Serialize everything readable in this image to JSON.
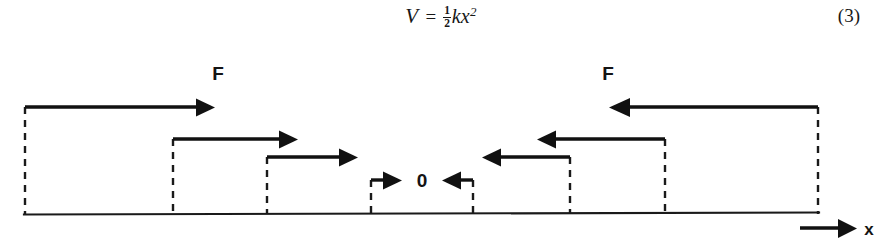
{
  "equation": {
    "variable": "V",
    "equals": "=",
    "fraction_numerator": "1",
    "fraction_denominator": "2",
    "body": "kx",
    "exponent": "2",
    "full_text": "V = 1/2 k x^2",
    "number": "(3)"
  },
  "diagram": {
    "axis_label_x": "x",
    "origin_label": "0",
    "force_label_left": "F",
    "force_label_right": "F",
    "baseline_color": "#1a1a1a",
    "arrow_color": "#111111",
    "dashed_color": "#1a1a1a",
    "baseline": {
      "x_start": 25,
      "x_end": 818,
      "y": 168
    },
    "axis_arrow": {
      "x_start": 800,
      "x_end": 858,
      "y": 182,
      "label": "x"
    },
    "origin": {
      "x": 422,
      "label_y": 136
    },
    "labels": [
      {
        "name": "force-label-left",
        "text": "F",
        "x": 218,
        "y": 34
      },
      {
        "name": "force-label-right",
        "text": "F",
        "x": 608,
        "y": 34
      },
      {
        "name": "origin-label",
        "text": "0",
        "x": 422,
        "y": 137
      }
    ],
    "force_arrows": [
      {
        "side": "left",
        "direction": "right",
        "level": 1,
        "x_tail": 25,
        "x_head": 213,
        "y": 61,
        "stem_x": 25,
        "stem_y_bottom": 168
      },
      {
        "side": "left",
        "direction": "right",
        "level": 2,
        "x_tail": 173,
        "x_head": 295,
        "y": 93,
        "stem_x": 173,
        "stem_y_bottom": 168
      },
      {
        "side": "left",
        "direction": "right",
        "level": 3,
        "x_tail": 267,
        "x_head": 355,
        "y": 111,
        "stem_x": 267,
        "stem_y_bottom": 168
      },
      {
        "side": "left",
        "direction": "right",
        "level": 4,
        "x_tail": 371,
        "x_head": 400,
        "y": 134,
        "stem_x": 371,
        "stem_y_bottom": 168
      },
      {
        "side": "right",
        "direction": "left",
        "level": 4,
        "x_tail": 473,
        "x_head": 444,
        "y": 134,
        "stem_x": 473,
        "stem_y_bottom": 168
      },
      {
        "side": "right",
        "direction": "left",
        "level": 3,
        "x_tail": 570,
        "x_head": 485,
        "y": 111,
        "stem_x": 570,
        "stem_y_bottom": 168
      },
      {
        "side": "right",
        "direction": "left",
        "level": 2,
        "x_tail": 665,
        "x_head": 540,
        "y": 93,
        "stem_x": 665,
        "stem_y_bottom": 168
      },
      {
        "side": "right",
        "direction": "left",
        "level": 1,
        "x_tail": 818,
        "x_head": 613,
        "y": 61,
        "stem_x": 818,
        "stem_y_bottom": 168
      }
    ],
    "dashed_verticals": [
      25,
      173,
      267,
      371,
      473,
      570,
      665,
      818
    ]
  }
}
